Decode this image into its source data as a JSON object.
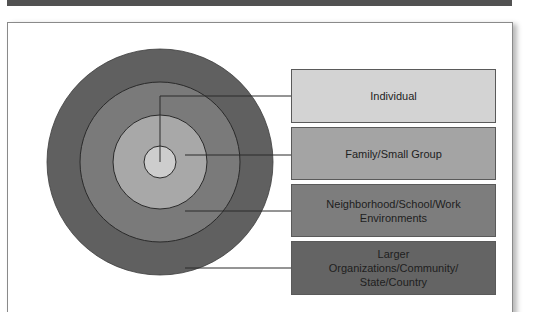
{
  "diagram": {
    "type": "concentric-levels",
    "center": {
      "x": 160,
      "y": 162
    },
    "rings": [
      {
        "name": "larger-organizations",
        "radius": 113,
        "color": "#606060"
      },
      {
        "name": "neighborhood",
        "radius": 80,
        "color": "#7a7a7a"
      },
      {
        "name": "family",
        "radius": 47,
        "color": "#a8a8a8"
      },
      {
        "name": "individual",
        "radius": 16,
        "color": "#cdcdcd"
      }
    ],
    "levels": [
      {
        "label": "Individual",
        "box_color": "#d3d3d3",
        "box_top": 69,
        "box_height": 54
      },
      {
        "label": "Family/Small Group",
        "box_color": "#a4a4a4",
        "box_top": 127,
        "box_height": 53
      },
      {
        "label": "Neighborhood/School/Work\nEnvironments",
        "box_color": "#7d7d7d",
        "box_top": 184,
        "box_height": 53
      },
      {
        "label": "Larger\nOrganizations/Community/\nState/Country",
        "box_color": "#646464",
        "box_top": 241,
        "box_height": 54
      }
    ]
  }
}
